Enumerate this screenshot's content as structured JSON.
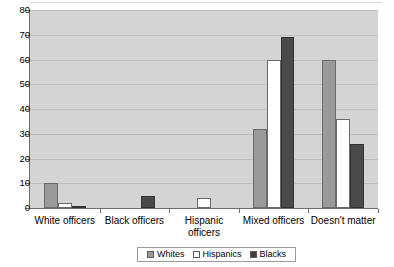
{
  "chart_data": {
    "type": "bar",
    "title": "",
    "subtitle": "",
    "xlabel": "",
    "ylabel": "",
    "ylim": [
      0,
      80
    ],
    "yticks": [
      0,
      10,
      20,
      30,
      40,
      50,
      60,
      70,
      80
    ],
    "grid": true,
    "legend_position": "bottom",
    "categories": [
      "White officers",
      "Black officers",
      "Hispanic officers",
      "Mixed officers",
      "Doesn't matter"
    ],
    "category_lines": [
      [
        "White officers"
      ],
      [
        "Black officers"
      ],
      [
        "Hispanic",
        "officers"
      ],
      [
        "Mixed officers"
      ],
      [
        "Doesn't matter"
      ]
    ],
    "series": [
      {
        "name": "Whites",
        "color": "#9a9a9a",
        "values": [
          10,
          0,
          0,
          32,
          60
        ]
      },
      {
        "name": "Hispanics",
        "color": "#ffffff",
        "values": [
          2,
          0,
          4,
          60,
          36
        ]
      },
      {
        "name": "Blacks",
        "color": "#4a4a4a",
        "values": [
          1,
          5,
          0,
          69,
          26
        ]
      }
    ]
  },
  "legend": {
    "items": [
      {
        "label": "Whites"
      },
      {
        "label": "Hispanics"
      },
      {
        "label": "Blacks"
      }
    ]
  },
  "colors": {
    "plot_background": "#d4d4d4",
    "gridline": "#bdbdbd",
    "axis": "#6e6e6e",
    "whites": "#9a9a9a",
    "hispanics": "#ffffff",
    "blacks": "#4a4a4a"
  }
}
